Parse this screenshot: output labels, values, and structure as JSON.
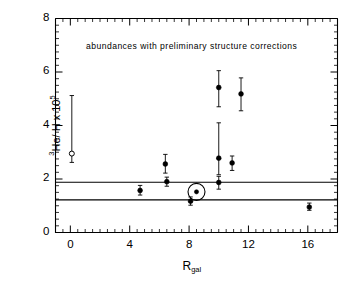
{
  "chart_data": {
    "type": "scatter",
    "title": "",
    "annotation": "abundances  with  preliminary structure  corrections",
    "xlabel": "R",
    "xlabel_sub": "gal",
    "ylabel_pre": "3",
    "ylabel_main": "He/ H x 10",
    "ylabel_exp": "5",
    "ylabel_full": "3He/H x 10^5",
    "xlim": [
      -1.0,
      18.0
    ],
    "ylim": [
      0,
      8
    ],
    "xticks": [
      0,
      4,
      8,
      12,
      16
    ],
    "xticklabels": [
      "0",
      "4",
      "8",
      "12",
      "16"
    ],
    "yticks": [
      0,
      2,
      4,
      6,
      8
    ],
    "yticklabels": [
      "0",
      "2",
      "4",
      "6",
      "8"
    ],
    "x_minor_step": 0.5,
    "y_minor_step": 0.25,
    "grid": false,
    "legend": "none",
    "hlines": [
      {
        "y": 1.88,
        "label": "upper reference level"
      },
      {
        "y": 1.22,
        "label": "lower reference level"
      }
    ],
    "series": [
      {
        "name": "3He/H abundances",
        "marker": "filled-circle",
        "points": [
          {
            "x": 0.1,
            "y": 2.95,
            "ylo": 2.62,
            "yhi": 5.12,
            "marker": "open-circle"
          },
          {
            "x": 4.7,
            "y": 1.57,
            "ylo": 1.4,
            "yhi": 1.76,
            "marker": "filled-circle"
          },
          {
            "x": 6.4,
            "y": 2.56,
            "ylo": 2.22,
            "yhi": 2.92,
            "marker": "filled-circle"
          },
          {
            "x": 6.5,
            "y": 1.9,
            "ylo": 1.73,
            "yhi": 2.07,
            "marker": "filled-circle"
          },
          {
            "x": 8.1,
            "y": 1.17,
            "ylo": 1.02,
            "yhi": 1.33,
            "marker": "filled-circle"
          },
          {
            "x": 8.5,
            "y": 1.52,
            "ylo": 1.52,
            "yhi": 1.52,
            "marker": "sun-symbol"
          },
          {
            "x": 10.0,
            "y": 5.42,
            "ylo": 4.7,
            "yhi": 6.05,
            "marker": "filled-circle"
          },
          {
            "x": 10.0,
            "y": 2.78,
            "ylo": 2.16,
            "yhi": 4.1,
            "marker": "filled-circle"
          },
          {
            "x": 10.0,
            "y": 1.87,
            "ylo": 1.62,
            "yhi": 2.1,
            "marker": "filled-circle"
          },
          {
            "x": 10.9,
            "y": 2.6,
            "ylo": 2.32,
            "yhi": 2.86,
            "marker": "filled-circle"
          },
          {
            "x": 11.5,
            "y": 5.18,
            "ylo": 4.55,
            "yhi": 5.78,
            "marker": "filled-circle"
          },
          {
            "x": 16.1,
            "y": 0.95,
            "ylo": 0.83,
            "yhi": 1.1,
            "marker": "filled-circle"
          }
        ]
      }
    ]
  }
}
